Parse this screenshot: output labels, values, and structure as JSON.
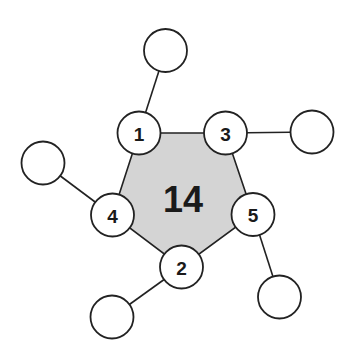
{
  "diagram": {
    "type": "ring-with-substituents",
    "ring_size_label": "14",
    "colors": {
      "ring_fill": "#d4d4d4",
      "stroke": "#222222",
      "node_fill": "#ffffff",
      "text": "#1a1a1a"
    },
    "ring_nodes": [
      {
        "id": "n1",
        "label": "1",
        "cx": 139,
        "cy": 133,
        "r": 21.5
      },
      {
        "id": "n3",
        "label": "3",
        "cx": 225.5,
        "cy": 133,
        "r": 21.5
      },
      {
        "id": "n5",
        "label": "5",
        "cx": 253,
        "cy": 214.5,
        "r": 21.5
      },
      {
        "id": "n2",
        "label": "2",
        "cx": 181.5,
        "cy": 267,
        "r": 21.5
      },
      {
        "id": "n4",
        "label": "4",
        "cx": 112.5,
        "cy": 215,
        "r": 21.5
      }
    ],
    "outer_nodes": [
      {
        "id": "o1",
        "attached_to": "1",
        "label": "",
        "cx": 165.5,
        "cy": 50.5,
        "r": 21.5
      },
      {
        "id": "o3",
        "attached_to": "3",
        "label": "",
        "cx": 312,
        "cy": 132,
        "r": 21.5
      },
      {
        "id": "o5",
        "attached_to": "5",
        "label": "",
        "cx": 279.5,
        "cy": 297,
        "r": 21.5
      },
      {
        "id": "o2",
        "attached_to": "2",
        "label": "",
        "cx": 112,
        "cy": 317,
        "r": 21.5
      },
      {
        "id": "o4",
        "attached_to": "4",
        "label": "",
        "cx": 43,
        "cy": 163,
        "r": 21.5
      }
    ],
    "center_label_pos": {
      "x": 183,
      "y": 199
    }
  }
}
